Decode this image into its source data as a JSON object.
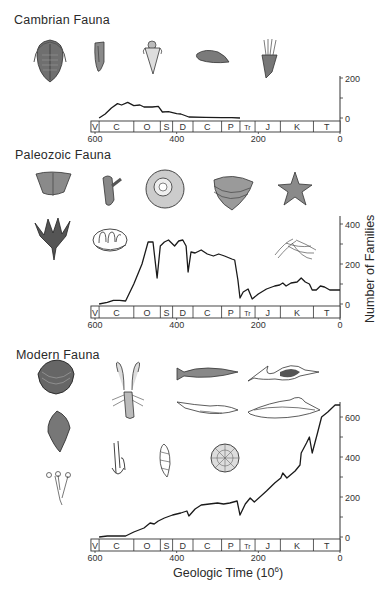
{
  "figure": {
    "y_axis_label": "Number of Families",
    "x_axis_label": "Geologic Time (10",
    "x_axis_label_sup": "6",
    "x_axis_label_end": ")",
    "periods": [
      "V",
      "C",
      "O",
      "S",
      "D",
      "C",
      "P",
      "Tr",
      "J",
      "K",
      "T"
    ],
    "period_boundaries_myr": [
      610,
      590,
      505,
      440,
      410,
      360,
      290,
      245,
      208,
      146,
      65,
      0
    ],
    "x_ticks": [
      "600",
      "400",
      "200",
      "0"
    ]
  },
  "sections": [
    {
      "title": "Cambrian Fauna",
      "y_ticks": [
        "200",
        "0"
      ],
      "icons": [
        "trilobite-icon",
        "hyolith-icon",
        "monoplacophoran-icon",
        "inarticulate-brachiopod-icon",
        "eocrinoid-icon"
      ]
    },
    {
      "title": "Paleozoic Fauna",
      "y_ticks": [
        "400",
        "200",
        "0"
      ],
      "icons": [
        "articulate-brachiopod-icon",
        "bryozoan-icon",
        "cephalopod-icon",
        "ostracod-icon",
        "starfish-icon",
        "crinoid-icon",
        "coral-icon",
        "graptolite-icon"
      ]
    },
    {
      "title": "Modern Fauna",
      "y_ticks": [
        "600",
        "400",
        "200",
        "0"
      ],
      "icons": [
        "bivalve-icon",
        "gastropod-icon",
        "hydrozoan-icon",
        "crayfish-icon",
        "fish-icon",
        "shark-icon",
        "ichthyosaur-icon",
        "marine-reptile-icon",
        "bryozoan-modern-icon",
        "foraminifera-icon",
        "echinoid-icon"
      ]
    }
  ],
  "chart_data": [
    {
      "type": "line",
      "title": "Cambrian Fauna",
      "xlabel": "Geologic Time (10^6)",
      "ylabel": "Number of Families",
      "xlim": [
        600,
        0
      ],
      "ylim": [
        0,
        200
      ],
      "x": [
        590,
        575,
        560,
        545,
        535,
        520,
        505,
        490,
        480,
        460,
        445,
        435,
        420,
        400,
        390,
        370,
        330,
        290,
        265,
        245
      ],
      "series": [
        {
          "name": "Cambrian Fauna",
          "values": [
            0,
            20,
            50,
            72,
            65,
            78,
            62,
            65,
            55,
            55,
            58,
            30,
            32,
            22,
            20,
            5,
            3,
            2,
            2,
            0
          ]
        }
      ]
    },
    {
      "type": "line",
      "title": "Paleozoic Fauna",
      "xlabel": "Geologic Time (10^6)",
      "ylabel": "Number of Families",
      "xlim": [
        600,
        0
      ],
      "ylim": [
        0,
        400
      ],
      "x": [
        590,
        570,
        555,
        540,
        525,
        505,
        485,
        470,
        458,
        448,
        440,
        430,
        420,
        405,
        395,
        385,
        377,
        372,
        365,
        355,
        340,
        325,
        310,
        297,
        283,
        265,
        258,
        250,
        245,
        237,
        225,
        215,
        200,
        180,
        160,
        148,
        140,
        132,
        120,
        105,
        95,
        85,
        75,
        68,
        58,
        48,
        38,
        25,
        0
      ],
      "series": [
        {
          "name": "Paleozoic Fauna",
          "values": [
            0,
            8,
            18,
            18,
            15,
            100,
            200,
            310,
            310,
            130,
            290,
            310,
            320,
            290,
            315,
            320,
            290,
            160,
            260,
            255,
            270,
            250,
            240,
            250,
            240,
            225,
            220,
            120,
            30,
            60,
            75,
            25,
            50,
            75,
            90,
            95,
            105,
            90,
            105,
            110,
            130,
            110,
            100,
            70,
            70,
            90,
            85,
            70,
            70
          ]
        }
      ]
    },
    {
      "type": "line",
      "title": "Modern Fauna",
      "xlabel": "Geologic Time (10^6)",
      "ylabel": "Number of Families",
      "xlim": [
        600,
        0
      ],
      "ylim": [
        0,
        700
      ],
      "x": [
        590,
        570,
        525,
        505,
        480,
        465,
        455,
        445,
        430,
        410,
        390,
        375,
        370,
        355,
        340,
        320,
        300,
        285,
        270,
        252,
        245,
        232,
        220,
        210,
        180,
        160,
        145,
        140,
        130,
        110,
        98,
        95,
        82,
        75,
        68,
        55,
        45,
        30,
        12,
        0
      ],
      "series": [
        {
          "name": "Modern Fauna",
          "values": [
            0,
            5,
            5,
            25,
            45,
            70,
            65,
            80,
            95,
            110,
            120,
            130,
            105,
            140,
            160,
            165,
            170,
            165,
            170,
            180,
            110,
            165,
            195,
            175,
            230,
            270,
            295,
            320,
            295,
            330,
            360,
            420,
            470,
            500,
            420,
            520,
            600,
            625,
            660,
            660
          ]
        }
      ]
    }
  ]
}
